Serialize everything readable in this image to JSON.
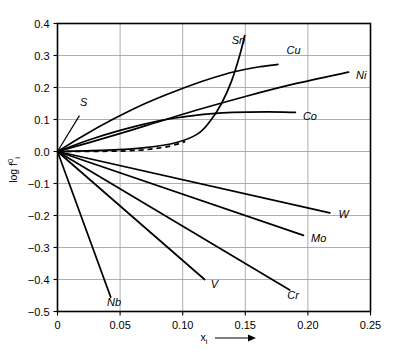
{
  "chart_data": {
    "type": "line",
    "title": "",
    "subtitle": "",
    "xlabel": "x",
    "xlabel_sub": "i",
    "xlabel_arrow": "⟶",
    "ylabel": "log f",
    "ylabel_sup": "0",
    "ylabel_sub": "i",
    "xlim": [
      0,
      0.25
    ],
    "ylim": [
      -0.5,
      0.4
    ],
    "grid": true,
    "legend": "inline-labels",
    "xticks": [
      0,
      0.05,
      0.1,
      0.15,
      0.2,
      0.25
    ],
    "xticklabels": [
      "0",
      "0.05",
      "0.10",
      "0.15",
      "0.20",
      "0.25"
    ],
    "yticks": [
      0.4,
      0.3,
      0.2,
      0.1,
      0.0,
      -0.1,
      -0.2,
      -0.3,
      -0.4,
      -0.5
    ],
    "yticklabels": [
      "0.4",
      "0.3",
      "0.2",
      "0.1",
      "0.0",
      "−0.1",
      "−0.2",
      "−0.3",
      "−0.4",
      "−0.5"
    ],
    "series": [
      {
        "name": "Sn",
        "label": "Sn",
        "style": "solid-with-dashed-tail",
        "points": [
          [
            0.0,
            0.0
          ],
          [
            0.04,
            0.004
          ],
          [
            0.07,
            0.012
          ],
          [
            0.095,
            0.028
          ],
          [
            0.112,
            0.055
          ],
          [
            0.122,
            0.095
          ],
          [
            0.131,
            0.15
          ],
          [
            0.139,
            0.22
          ],
          [
            0.1455,
            0.3
          ],
          [
            0.1495,
            0.362
          ]
        ],
        "dashed_points": [
          [
            0.0,
            0.0
          ],
          [
            0.055,
            0.002
          ],
          [
            0.085,
            0.013
          ],
          [
            0.102,
            0.031
          ]
        ],
        "label_pos": [
          0.128,
          0.335
        ]
      },
      {
        "name": "Cu",
        "label": "Cu",
        "style": "solid",
        "points": [
          [
            0.0,
            0.0
          ],
          [
            0.02,
            0.048
          ],
          [
            0.045,
            0.102
          ],
          [
            0.07,
            0.15
          ],
          [
            0.095,
            0.19
          ],
          [
            0.12,
            0.225
          ],
          [
            0.142,
            0.25
          ],
          [
            0.162,
            0.265
          ],
          [
            0.176,
            0.272
          ]
        ],
        "label_pos": [
          0.183,
          0.305
        ]
      },
      {
        "name": "Ni",
        "label": "Ni",
        "style": "solid",
        "points": [
          [
            0.0,
            0.0
          ],
          [
            0.03,
            0.033
          ],
          [
            0.07,
            0.08
          ],
          [
            0.11,
            0.128
          ],
          [
            0.15,
            0.172
          ],
          [
            0.19,
            0.212
          ],
          [
            0.2325,
            0.248
          ]
        ],
        "label_pos": [
          0.2385,
          0.228
        ]
      },
      {
        "name": "Co",
        "label": "Co",
        "style": "solid",
        "points": [
          [
            0.0,
            0.0
          ],
          [
            0.025,
            0.036
          ],
          [
            0.05,
            0.066
          ],
          [
            0.08,
            0.095
          ],
          [
            0.11,
            0.113
          ],
          [
            0.14,
            0.122
          ],
          [
            0.168,
            0.124
          ],
          [
            0.19,
            0.122
          ]
        ],
        "label_pos": [
          0.196,
          0.097
        ]
      },
      {
        "name": "W",
        "label": "W",
        "style": "solid",
        "points": [
          [
            0.0,
            0.0
          ],
          [
            0.2175,
            -0.192
          ]
        ],
        "label_pos": [
          0.2245,
          -0.207
        ]
      },
      {
        "name": "Mo",
        "label": "Mo",
        "style": "solid",
        "points": [
          [
            0.0,
            0.0
          ],
          [
            0.1965,
            -0.262
          ]
        ],
        "label_pos": [
          0.2025,
          -0.282
        ]
      },
      {
        "name": "Cr",
        "label": "Cr",
        "style": "solid",
        "points": [
          [
            0.0,
            0.0
          ],
          [
            0.1855,
            -0.433
          ]
        ],
        "label_pos": [
          0.1835,
          -0.462
        ]
      },
      {
        "name": "V",
        "label": "V",
        "style": "solid",
        "points": [
          [
            0.0,
            0.0
          ],
          [
            0.1175,
            -0.4
          ]
        ],
        "label_pos": [
          0.1225,
          -0.428
        ]
      },
      {
        "name": "Nb",
        "label": "Nb",
        "style": "solid",
        "points": [
          [
            0.0,
            0.0
          ],
          [
            0.0425,
            -0.455
          ]
        ],
        "label_pos": [
          0.0395,
          -0.483
        ]
      },
      {
        "name": "S",
        "label": "S",
        "style": "leader",
        "points": [
          [
            0.0,
            0.0
          ],
          [
            0.0175,
            0.112
          ]
        ],
        "label_pos": [
          0.0155,
          0.135
        ]
      }
    ]
  }
}
